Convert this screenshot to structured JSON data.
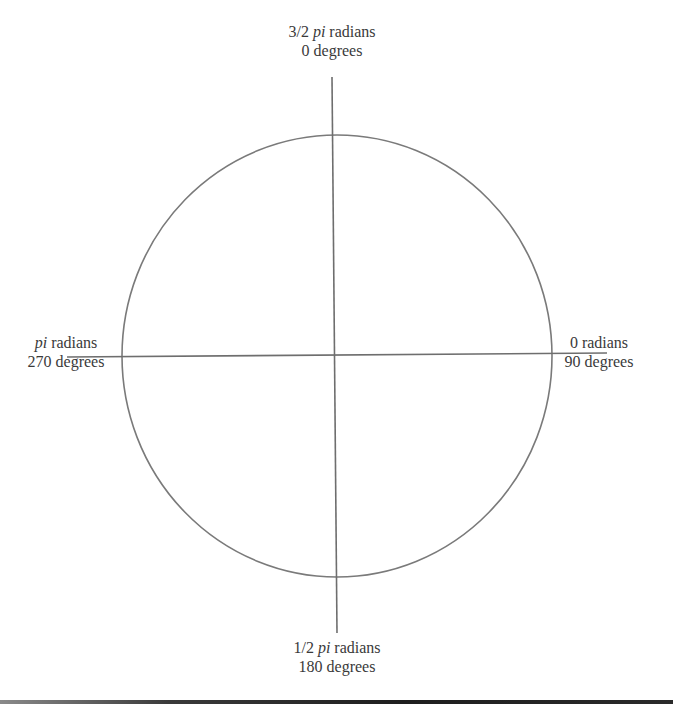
{
  "diagram": {
    "type": "unit-circle-angle-reference",
    "colors": {
      "stroke": "#7a7a7a",
      "text": "#3a3a3a",
      "background": "#ffffff",
      "bottom_bar": "#1e1e1e"
    },
    "labels": {
      "top": {
        "radians_prefix": "3/2",
        "radians_italic": "pi",
        "radians_suffix": "radians",
        "degrees": "0 degrees"
      },
      "right": {
        "radians_prefix": "0",
        "radians_italic": "",
        "radians_suffix": "radians",
        "degrees": "90 degrees"
      },
      "bottom": {
        "radians_prefix": "1/2",
        "radians_italic": "pi",
        "radians_suffix": "radians",
        "degrees": "180 degrees"
      },
      "left": {
        "radians_prefix": "",
        "radians_italic": "pi",
        "radians_suffix": "radians",
        "degrees": "270 degrees"
      }
    }
  }
}
